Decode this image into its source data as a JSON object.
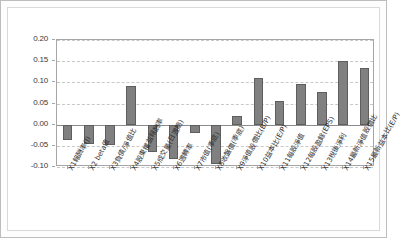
{
  "chart": {
    "title": "",
    "background_color": "#ffffff",
    "bar_color": "#808080",
    "bar_border_color": "#5e5e5e",
    "grid_color": "#c8c8c8",
    "axis_color": "#a6a6a6"
  },
  "chart_data": {
    "type": "bar",
    "title": "",
    "xlabel": "",
    "ylabel": "",
    "ylim": [
      -0.1,
      0.2
    ],
    "yticks": [
      "0.20",
      "0.15",
      "0.10",
      "0.05",
      "0.00",
      "-0.05",
      "-0.10"
    ],
    "ytick_values": [
      0.2,
      0.15,
      0.1,
      0.05,
      0.0,
      -0.05,
      -0.1
    ],
    "grid": true,
    "grid_style": "dashed-horizontal",
    "legend": false,
    "categories": [
      "X1報酬率(J)",
      "X2 beta值",
      "X3負債/淨值比",
      "X4股東權益報酬率",
      "X5成交量(日週期)",
      "X6週轉率",
      "X7市值(季底)",
      "X8收盤價(季底)",
      "X9淨值股價比(B/P)",
      "X10益本比(E/P)",
      "X11每股淨值",
      "X12每股盈餘(EPS)",
      "X13稅後淨利",
      "X14最新淨值股價比",
      "X15最新益本比(E/P)"
    ],
    "values": [
      -0.036,
      -0.045,
      -0.048,
      0.092,
      -0.065,
      -0.082,
      -0.019,
      -0.094,
      0.021,
      0.111,
      0.055,
      0.097,
      0.077,
      0.151,
      0.134
    ]
  }
}
